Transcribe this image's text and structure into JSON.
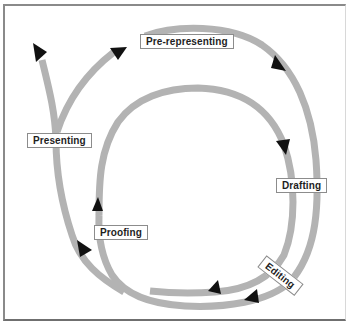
{
  "diagram": {
    "type": "cycle-spiral",
    "stages": [
      {
        "id": "pre-representing",
        "label": "Pre-representing"
      },
      {
        "id": "drafting",
        "label": "Drafting"
      },
      {
        "id": "editing",
        "label": "Editing"
      },
      {
        "id": "proofing",
        "label": "Proofing"
      },
      {
        "id": "presenting",
        "label": "Presenting"
      }
    ],
    "flow": [
      [
        "Pre-representing",
        "Drafting"
      ],
      [
        "Drafting",
        "Editing"
      ],
      [
        "Editing",
        "Proofing"
      ],
      [
        "Proofing",
        "Drafting"
      ],
      [
        "Proofing",
        "Presenting"
      ],
      [
        "Presenting",
        "Pre-representing"
      ]
    ],
    "colors": {
      "track": "#b3b3b3",
      "arrowhead": "#111111",
      "label_border": "#8c8c8c",
      "frame": "#8a8a8a"
    }
  }
}
